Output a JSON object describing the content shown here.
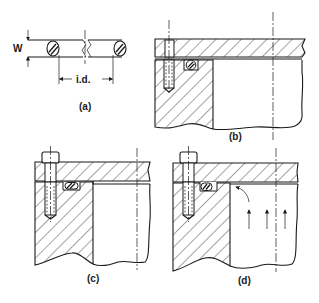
{
  "figure": {
    "panels": [
      {
        "id": "a",
        "label": "(a)",
        "dimensions": {
          "width_label": "W",
          "inner_diameter_label": "i.d."
        }
      },
      {
        "id": "b",
        "label": "(b)"
      },
      {
        "id": "c",
        "label": "(c)"
      },
      {
        "id": "d",
        "label": "(d)",
        "note": "pressure arrows acting upward"
      }
    ]
  }
}
